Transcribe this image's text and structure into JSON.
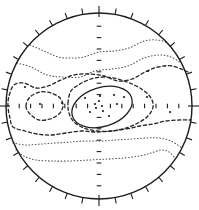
{
  "chart_data": {
    "type": "contour",
    "canvas": {
      "width": 199,
      "height": 210,
      "background": "#ffffff"
    },
    "projection_circle": {
      "cx": 99,
      "cy": 106,
      "r": 93
    },
    "perimeter_ticks": {
      "count": 36,
      "step_deg": 10,
      "outer_len": 6,
      "cardinal_inner_len": 4,
      "cardinal_outer_len": 7
    },
    "axis_graticule": {
      "tick_spacing": 11.4,
      "ticks_per_side": 7,
      "tick_len": 4.6
    },
    "styles": {
      "solid": {
        "stroke": "#1d1d1b",
        "width": 1.25,
        "dash": ""
      },
      "dashed": {
        "stroke": "#242422",
        "width": 1.3,
        "dash": "3.2 2.6"
      },
      "dotted": {
        "stroke": "#4d4d4a",
        "width": 1.05,
        "dash": "0.7 2.5"
      },
      "frame": {
        "stroke": "#1d1d1b",
        "width": 1.4
      },
      "tick": {
        "stroke": "#1d1d1b",
        "width": 1.1
      },
      "dot_fill": "#1d1d1b"
    },
    "contour_levels": [
      {
        "id": "dotted-north-1",
        "style": "dotted",
        "closed": false,
        "points": [
          [
            30,
            45
          ],
          [
            44,
            51
          ],
          [
            58,
            57
          ],
          [
            71,
            58
          ],
          [
            84,
            57
          ],
          [
            99,
            52
          ],
          [
            114,
            51
          ],
          [
            129,
            48
          ],
          [
            144,
            41
          ],
          [
            157,
            40
          ],
          [
            167,
            43
          ],
          [
            174,
            51
          ]
        ]
      },
      {
        "id": "dotted-north-2",
        "style": "dotted",
        "closed": false,
        "points": [
          [
            17,
            63
          ],
          [
            31,
            67
          ],
          [
            47,
            75
          ],
          [
            63,
            77
          ],
          [
            80,
            77
          ],
          [
            95,
            71
          ],
          [
            112,
            69
          ],
          [
            128,
            66
          ],
          [
            144,
            58
          ],
          [
            159,
            55
          ],
          [
            171,
            57
          ],
          [
            181,
            63
          ]
        ]
      },
      {
        "id": "mid-dashed-band",
        "style": "dashed",
        "closed": false,
        "points": [
          [
            188,
            72
          ],
          [
            172,
            66
          ],
          [
            158,
            67
          ],
          [
            145,
            72
          ],
          [
            132,
            79
          ],
          [
            118,
            81
          ],
          [
            104,
            76
          ],
          [
            89,
            74
          ],
          [
            74,
            75
          ],
          [
            61,
            80
          ],
          [
            48,
            86
          ],
          [
            36,
            88
          ],
          [
            24,
            83
          ],
          [
            14,
            85
          ],
          [
            9,
            96
          ],
          [
            8,
            107
          ],
          [
            10,
            118
          ],
          [
            13,
            127
          ],
          [
            25,
            131
          ],
          [
            37,
            134
          ],
          [
            51,
            135
          ],
          [
            66,
            133
          ],
          [
            81,
            131
          ],
          [
            96,
            132
          ],
          [
            111,
            131
          ],
          [
            126,
            129
          ],
          [
            140,
            126
          ],
          [
            153,
            124
          ],
          [
            166,
            121
          ],
          [
            179,
            120
          ],
          [
            191,
            120
          ]
        ]
      },
      {
        "id": "inner-dashed-loop",
        "style": "dashed",
        "closed": true,
        "points": [
          [
            68,
            103
          ],
          [
            71,
            91
          ],
          [
            80,
            84
          ],
          [
            91,
            79
          ],
          [
            104,
            77
          ],
          [
            118,
            79
          ],
          [
            132,
            84
          ],
          [
            143,
            90
          ],
          [
            151,
            98
          ],
          [
            153,
            107
          ],
          [
            148,
            116
          ],
          [
            138,
            123
          ],
          [
            126,
            128
          ],
          [
            112,
            131
          ],
          [
            97,
            131
          ],
          [
            84,
            128
          ],
          [
            74,
            122
          ],
          [
            69,
            113
          ]
        ]
      },
      {
        "id": "west-dashed-loop",
        "style": "dashed",
        "closed": true,
        "points": [
          [
            26,
            106
          ],
          [
            30,
            97
          ],
          [
            40,
            92
          ],
          [
            51,
            93
          ],
          [
            60,
            98
          ],
          [
            63,
            106
          ],
          [
            59,
            114
          ],
          [
            50,
            119
          ],
          [
            39,
            120
          ],
          [
            30,
            114
          ]
        ]
      },
      {
        "id": "center-solid-ellipse",
        "style": "solid",
        "closed": true,
        "ellipse": {
          "cx": 102,
          "cy": 107,
          "rx": 31,
          "ry": 19.5,
          "rotate": -17
        }
      },
      {
        "id": "dotted-south-1",
        "style": "dotted",
        "closed": false,
        "points": [
          [
            13,
            143
          ],
          [
            26,
            145
          ],
          [
            41,
            144
          ],
          [
            56,
            143
          ],
          [
            71,
            142
          ],
          [
            86,
            141
          ],
          [
            101,
            141
          ],
          [
            116,
            140
          ],
          [
            131,
            139
          ],
          [
            146,
            138
          ],
          [
            159,
            138
          ],
          [
            171,
            141
          ],
          [
            182,
            148
          ]
        ]
      },
      {
        "id": "dotted-south-2",
        "style": "dotted",
        "closed": false,
        "points": [
          [
            16,
            150
          ],
          [
            24,
            156
          ],
          [
            36,
            160
          ],
          [
            52,
            161
          ],
          [
            70,
            161
          ],
          [
            89,
            160
          ],
          [
            107,
            159
          ],
          [
            124,
            158
          ],
          [
            139,
            156
          ],
          [
            151,
            153
          ],
          [
            161,
            150
          ],
          [
            169,
            152
          ],
          [
            175,
            158
          ]
        ]
      }
    ],
    "scatter_points": [
      [
        25,
        87
      ],
      [
        40,
        104
      ],
      [
        62,
        103
      ],
      [
        148,
        71
      ],
      [
        147,
        97
      ],
      [
        170,
        112
      ],
      [
        85,
        98
      ],
      [
        100,
        96
      ],
      [
        114,
        95
      ],
      [
        124,
        97
      ],
      [
        95,
        104
      ],
      [
        99,
        101
      ],
      [
        102,
        106
      ],
      [
        96,
        108
      ],
      [
        103,
        111
      ],
      [
        90,
        112
      ],
      [
        109,
        116
      ],
      [
        117,
        104
      ]
    ]
  }
}
